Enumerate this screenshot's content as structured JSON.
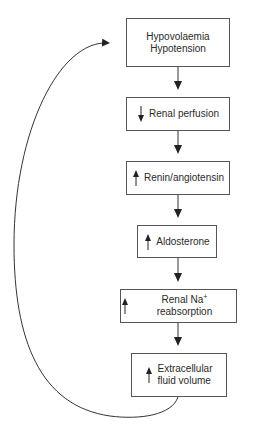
{
  "diagram": {
    "nodes": [
      {
        "id": "hypovolaemia",
        "lines": [
          "Hypovolaemia",
          "Hypotension"
        ],
        "direction": "none"
      },
      {
        "id": "renal-perfusion",
        "lines": [
          "Renal perfusion"
        ],
        "direction": "down"
      },
      {
        "id": "renin-angiotensin",
        "lines": [
          "Renin/angiotensin"
        ],
        "direction": "up"
      },
      {
        "id": "aldosterone",
        "lines": [
          "Aldosterone"
        ],
        "direction": "up"
      },
      {
        "id": "renal-na-reabsorption",
        "lines": [
          "Renal Na",
          "+",
          " reabsorption"
        ],
        "direction": "up"
      },
      {
        "id": "extracellular-fluid-volume",
        "lines": [
          "Extracellular",
          "fluid volume"
        ],
        "direction": "up"
      }
    ],
    "edges": [
      {
        "from": "hypovolaemia",
        "to": "renal-perfusion"
      },
      {
        "from": "renal-perfusion",
        "to": "renin-angiotensin"
      },
      {
        "from": "renin-angiotensin",
        "to": "aldosterone"
      },
      {
        "from": "aldosterone",
        "to": "renal-na-reabsorption"
      },
      {
        "from": "renal-na-reabsorption",
        "to": "extracellular-fluid-volume"
      },
      {
        "from": "extracellular-fluid-volume",
        "to": "hypovolaemia",
        "type": "feedback-loop"
      }
    ],
    "colors": {
      "line": "#333333",
      "box_border": "#555555",
      "text": "#2a2a2a"
    }
  }
}
